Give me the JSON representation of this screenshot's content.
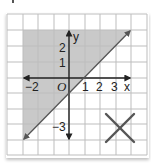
{
  "graph": {
    "type": "linear-inequality",
    "boundary_line": {
      "equation": "y = x - 1",
      "style": "solid",
      "slope": 1,
      "y_intercept": -1,
      "x_intercept": 1
    },
    "shaded_region": "above line",
    "grid": {
      "x_min": -4,
      "x_max": 5,
      "y_min": -5,
      "y_max": 4
    },
    "axis_labels": {
      "x": "x",
      "y": "y"
    },
    "x_ticks": [
      "−2",
      "1",
      "2",
      "3"
    ],
    "y_ticks": [
      "2",
      "1",
      "−3"
    ],
    "origin_label": "O",
    "mark": "X",
    "colors": {
      "shade": "#c9c9c9",
      "grid": "#bdbdbd",
      "line": "#555555",
      "axis": "#222222",
      "mark": "#555555"
    }
  }
}
